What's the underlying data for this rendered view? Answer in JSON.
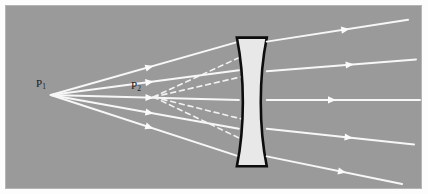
{
  "figure": {
    "kind": "optics-ray-diagram",
    "panel": {
      "background_color": "#9a9a9a",
      "border_color": "#b5b5b5",
      "outer_background": "#fdfdfd",
      "x": 5,
      "y": 5,
      "width": 417,
      "height": 184
    },
    "labels": [
      {
        "id": "p1",
        "base": "P",
        "subscript": "1",
        "text": "P1",
        "x": 30,
        "y": 72,
        "color": "#1b1b1b",
        "meaning": "object-point"
      },
      {
        "id": "p2",
        "base": "P",
        "subscript": "2",
        "text": "P2",
        "x": 125,
        "y": 74,
        "color": "#1b1b1b",
        "meaning": "virtual-image-point"
      }
    ],
    "points": {
      "p1": {
        "x": 45,
        "y": 90,
        "name": "object point P1"
      },
      "p2": {
        "x": 148,
        "y": 92,
        "name": "virtual image point P2"
      }
    },
    "lens": {
      "type": "biconcave-diverging",
      "fill": "#e8e8e8",
      "stroke": "#0d0d0d",
      "stroke_width": 2.6,
      "top_y": 32,
      "bottom_y": 162,
      "left_edge_x": 232,
      "right_edge_x": 262,
      "waist_inset": 9,
      "outline_path": "M 232 32 L 262 32 C 254 72 254 122 262 162 L 232 162 C 240 122 240 72 232 32 Z"
    },
    "ray_style": {
      "solid_color": "#f7f7f7",
      "dashed_color": "#f2f2f2",
      "solid_width": 2.0,
      "dashed_width": 1.6,
      "dash_pattern": "5 4",
      "arrow_color": "#fbfbfb",
      "arrow_size": 7
    },
    "incident_rays": [
      {
        "id": "in-1",
        "from_x": 45,
        "from_y": 90,
        "to_x": 234,
        "to_y": 36,
        "arrow_t": 0.52
      },
      {
        "id": "in-2",
        "from_x": 45,
        "from_y": 90,
        "to_x": 234,
        "to_y": 65,
        "arrow_t": 0.52
      },
      {
        "id": "in-3",
        "from_x": 45,
        "from_y": 90,
        "to_x": 234,
        "to_y": 95,
        "arrow_t": 0.52
      },
      {
        "id": "in-4",
        "from_x": 45,
        "from_y": 90,
        "to_x": 234,
        "to_y": 124,
        "arrow_t": 0.52
      },
      {
        "id": "in-5",
        "from_x": 45,
        "from_y": 90,
        "to_x": 234,
        "to_y": 152,
        "arrow_t": 0.52
      }
    ],
    "virtual_rays": [
      {
        "id": "virt-1",
        "from_x": 148,
        "from_y": 92,
        "to_x": 252,
        "to_y": 44
      },
      {
        "id": "virt-2",
        "from_x": 148,
        "from_y": 92,
        "to_x": 252,
        "to_y": 68
      },
      {
        "id": "virt-3",
        "from_x": 148,
        "from_y": 92,
        "to_x": 252,
        "to_y": 118
      },
      {
        "id": "virt-4",
        "from_x": 148,
        "from_y": 92,
        "to_x": 252,
        "to_y": 142
      }
    ],
    "emergent_rays": [
      {
        "id": "out-1",
        "from_x": 262,
        "from_y": 36,
        "to_x": 404,
        "to_y": 14,
        "arrow_t": 0.55
      },
      {
        "id": "out-2",
        "from_x": 262,
        "from_y": 66,
        "to_x": 412,
        "to_y": 54,
        "arrow_t": 0.55
      },
      {
        "id": "out-3",
        "from_x": 262,
        "from_y": 95,
        "to_x": 416,
        "to_y": 95,
        "arrow_t": 0.42
      },
      {
        "id": "out-4",
        "from_x": 262,
        "from_y": 124,
        "to_x": 410,
        "to_y": 140,
        "arrow_t": 0.55
      },
      {
        "id": "out-5",
        "from_x": 262,
        "from_y": 152,
        "to_x": 398,
        "to_y": 180,
        "arrow_t": 0.55
      }
    ]
  }
}
